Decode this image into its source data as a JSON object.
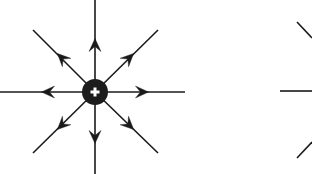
{
  "figure": {
    "domain": "Diagram",
    "kind": "electric-field-line-diagram",
    "canvas": {
      "width": 312,
      "height": 174
    },
    "background_color": "#ffffff",
    "line_color": "#1a1a1a",
    "charge": {
      "label": "+",
      "sign": "positive",
      "center_x": 95,
      "center_y": 92,
      "radius": 13,
      "fill_color": "#1c1c1c",
      "symbol_color": "#ffffff",
      "symbol_arm_length": 9,
      "symbol_thickness": 3
    },
    "field_lines": {
      "count": 8,
      "stroke_width": 1.6,
      "arrow_direction": "outward",
      "arrow_length": 13,
      "arrow_half_width": 6,
      "lines": [
        {
          "name": "field-line-east",
          "angle_deg": 0,
          "x1": 95,
          "y1": 92,
          "x2": 185,
          "y2": 92,
          "arrow_x": 142,
          "arrow_y": 92
        },
        {
          "name": "field-line-northeast",
          "angle_deg": 45,
          "x1": 95,
          "y1": 92,
          "x2": 158,
          "y2": 30,
          "arrow_x": 129,
          "arrow_y": 58
        },
        {
          "name": "field-line-north",
          "angle_deg": 90,
          "x1": 95,
          "y1": 92,
          "x2": 95,
          "y2": 0,
          "arrow_x": 95,
          "arrow_y": 45
        },
        {
          "name": "field-line-northwest",
          "angle_deg": 135,
          "x1": 95,
          "y1": 92,
          "x2": 33,
          "y2": 30,
          "arrow_x": 62,
          "arrow_y": 58
        },
        {
          "name": "field-line-west",
          "angle_deg": 180,
          "x1": 95,
          "y1": 92,
          "x2": 0,
          "y2": 92,
          "arrow_x": 48,
          "arrow_y": 92
        },
        {
          "name": "field-line-southwest",
          "angle_deg": 225,
          "x1": 95,
          "y1": 92,
          "x2": 33,
          "y2": 153,
          "arrow_x": 62,
          "arrow_y": 125
        },
        {
          "name": "field-line-south",
          "angle_deg": 270,
          "x1": 95,
          "y1": 92,
          "x2": 95,
          "y2": 174,
          "arrow_x": 95,
          "arrow_y": 137
        },
        {
          "name": "field-line-southeast",
          "angle_deg": 315,
          "x1": 95,
          "y1": 92,
          "x2": 158,
          "y2": 153,
          "arrow_x": 129,
          "arrow_y": 125
        }
      ]
    },
    "adjacent_figure_fragment": {
      "description": "Partially visible neighboring figure clipped at the right edge",
      "stroke_width": 1.6,
      "segments": [
        {
          "name": "fragment-line-horizontal",
          "x1": 280,
          "y1": 91,
          "x2": 312,
          "y2": 91
        },
        {
          "name": "fragment-line-upper-right",
          "x1": 297,
          "y1": 22,
          "x2": 312,
          "y2": 38
        },
        {
          "name": "fragment-line-lower-right",
          "x1": 297,
          "y1": 158,
          "x2": 312,
          "y2": 142
        }
      ]
    }
  }
}
